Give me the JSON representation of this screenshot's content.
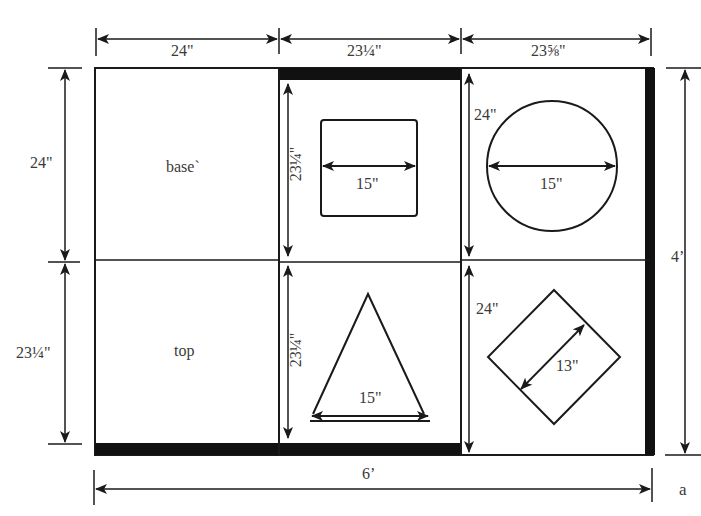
{
  "figure": {
    "label": "a",
    "overall": {
      "width": "6’",
      "height": "4’"
    },
    "columns": [
      {
        "label": "24\""
      },
      {
        "label": "23¼\""
      },
      {
        "label": "23⅝\""
      }
    ],
    "rows_left": [
      {
        "label": "24\""
      },
      {
        "label": "23¼\""
      }
    ],
    "panels": [
      {
        "id": "base",
        "text": "base`"
      },
      {
        "id": "square-hole",
        "height_label": "23¼\"",
        "shape": "square",
        "dim_label": "15\""
      },
      {
        "id": "circle-hole",
        "height_label": "24\"",
        "shape": "circle",
        "dim_label": "15\""
      },
      {
        "id": "top",
        "text": "top"
      },
      {
        "id": "triangle-hole",
        "height_label": "23¼\"",
        "shape": "triangle",
        "dim_label": "15\""
      },
      {
        "id": "diamond-hole",
        "height_label": "24\"",
        "shape": "diamond",
        "dim_label": "13\""
      }
    ]
  },
  "colors": {
    "line": "#1a1a1a",
    "text": "#3a3a3a",
    "background": "#ffffff"
  }
}
